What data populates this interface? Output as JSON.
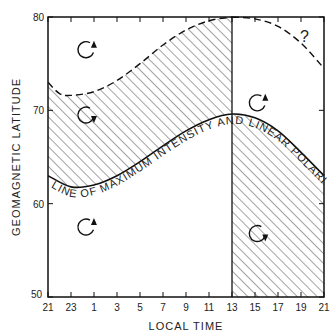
{
  "chart_data": {
    "type": "line",
    "title": "",
    "xlabel": "LOCAL TIME",
    "ylabel": "GEOMAGNETIC LATITUDE",
    "x_ticks": [
      "21",
      "23",
      "1",
      "3",
      "5",
      "7",
      "9",
      "11",
      "13",
      "15",
      "17",
      "19",
      "21"
    ],
    "y_ticks": [
      "50",
      "60",
      "70",
      "80"
    ],
    "ylim": [
      50,
      80
    ],
    "xlim_hours": [
      21,
      45
    ],
    "grid": false,
    "series": [
      {
        "name": "Line of maximum intensity and linear polarization",
        "style": "solid",
        "x": [
          21,
          23,
          1,
          3,
          5,
          7,
          9,
          11,
          13,
          15,
          17,
          19,
          21
        ],
        "y": [
          63.0,
          61.8,
          62.0,
          63.0,
          64.5,
          66.2,
          67.8,
          69.0,
          69.6,
          69.2,
          67.8,
          65.5,
          63.0
        ]
      },
      {
        "name": "Upper boundary (dashed)",
        "style": "dashed",
        "x": [
          21,
          22,
          23,
          1,
          3,
          5,
          7,
          9,
          11,
          13
        ],
        "y": [
          73.0,
          71.8,
          71.6,
          72.0,
          73.2,
          75.0,
          77.0,
          78.6,
          79.6,
          80.0
        ]
      },
      {
        "name": "Upper boundary dashed arc (uncertain)",
        "style": "dashed",
        "x": [
          13,
          15,
          17,
          19,
          21
        ],
        "y": [
          80.0,
          79.8,
          79.0,
          77.2,
          74.5
        ]
      }
    ],
    "annotations": [
      {
        "text": "LINE OF MAXIMUM INTENSITY AND LINEAR POLARIZATION",
        "along": "solid curve"
      },
      {
        "text": "?",
        "position": "upper right"
      }
    ],
    "regions": [
      {
        "name": "hatched-upper-left",
        "desc": "between dashed boundary and solid curve, 21-13 LT",
        "hatched": true
      },
      {
        "name": "hatched-lower-right",
        "desc": "below solid curve, 13-21 LT",
        "hatched": true
      }
    ],
    "rotation_symbols": [
      {
        "lt_x": 3.3,
        "lat": 76.5,
        "sense": "counterclockwise"
      },
      {
        "lt_x": 3.3,
        "lat": 69.5,
        "sense": "clockwise"
      },
      {
        "lt_x": 3.3,
        "lat": 57.5,
        "sense": "counterclockwise"
      },
      {
        "lt_x": 18.2,
        "lat": 70.8,
        "sense": "counterclockwise"
      },
      {
        "lt_x": 18.2,
        "lat": 56.8,
        "sense": "clockwise"
      }
    ]
  },
  "labels": {
    "xlabel": "LOCAL TIME",
    "ylabel": "GEOMAGNETIC LATITUDE",
    "curve_label": "LINE OF MAXIMUM INTENSITY AND LINEAR POLARIZATION",
    "question": "?"
  }
}
